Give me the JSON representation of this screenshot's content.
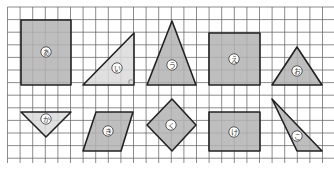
{
  "figure": {
    "grid": {
      "x0": 7.5,
      "y0": 7,
      "cell": 12.6,
      "cols": 26,
      "rows": 12.4,
      "line_color": "#5a5a5a",
      "background": "#ffffff"
    },
    "colors": {
      "dark_fill": "#b3b3b3",
      "light_fill": "#dadada",
      "outline": "#222222",
      "label_bg": "#ffffff",
      "label_text": "#333333"
    },
    "shapes": [
      {
        "label": "あ",
        "type": "rectangle",
        "fill": "dark",
        "points": [
          [
            21,
            20
          ],
          [
            71,
            20
          ],
          [
            71,
            85
          ],
          [
            21,
            85
          ]
        ],
        "label_pos": [
          46,
          52
        ]
      },
      {
        "label": "い",
        "type": "right-triangle",
        "fill": "light",
        "points": [
          [
            83,
            85
          ],
          [
            134,
            33
          ],
          [
            134,
            85
          ]
        ],
        "label_pos": [
          117,
          68
        ],
        "right_angle_mark": true
      },
      {
        "label": "う",
        "type": "isosceles-triangle",
        "fill": "dark",
        "points": [
          [
            172,
            21
          ],
          [
            196,
            85
          ],
          [
            147,
            85
          ]
        ],
        "label_pos": [
          172,
          65
        ]
      },
      {
        "label": "え",
        "type": "rectangle",
        "fill": "dark",
        "points": [
          [
            209,
            33
          ],
          [
            260,
            33
          ],
          [
            260,
            85
          ],
          [
            209,
            85
          ]
        ],
        "label_pos": [
          234,
          59
        ]
      },
      {
        "label": "お",
        "type": "triangle",
        "fill": "dark",
        "points": [
          [
            297,
            47
          ],
          [
            322,
            85
          ],
          [
            272,
            85
          ]
        ],
        "label_pos": [
          297,
          71
        ]
      },
      {
        "label": "か",
        "type": "inverted-triangle",
        "fill": "light",
        "points": [
          [
            21,
            112
          ],
          [
            71,
            112
          ],
          [
            46,
            137
          ]
        ],
        "label_pos": [
          46,
          119
        ]
      },
      {
        "label": "き",
        "type": "parallelogram",
        "fill": "dark",
        "points": [
          [
            96,
            112
          ],
          [
            133,
            112
          ],
          [
            121,
            151
          ],
          [
            83,
            151
          ]
        ],
        "label_pos": [
          108,
          131
        ]
      },
      {
        "label": "く",
        "type": "square-diamond",
        "fill": "dark",
        "points": [
          [
            172,
            99
          ],
          [
            196,
            125
          ],
          [
            172,
            151
          ],
          [
            147,
            125
          ]
        ],
        "label_pos": [
          171,
          125
        ]
      },
      {
        "label": "け",
        "type": "rectangle",
        "fill": "dark",
        "points": [
          [
            209,
            112
          ],
          [
            260,
            112
          ],
          [
            260,
            151
          ],
          [
            209,
            151
          ]
        ],
        "label_pos": [
          234,
          132
        ]
      },
      {
        "label": "こ",
        "type": "triangle",
        "fill": "dark",
        "points": [
          [
            272,
            99
          ],
          [
            322,
            151
          ],
          [
            297,
            151
          ]
        ],
        "label_pos": [
          297,
          136
        ]
      }
    ]
  }
}
